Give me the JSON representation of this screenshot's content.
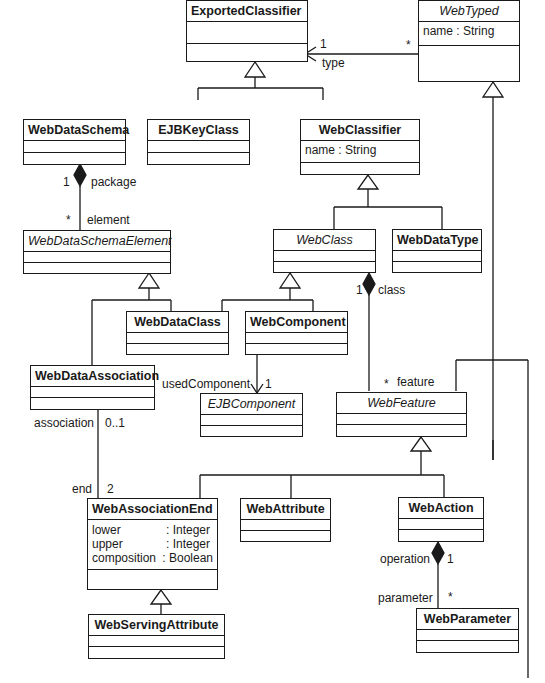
{
  "diagram": {
    "type": "UML class diagram",
    "classes": {
      "exported_classifier": {
        "name": "ExportedClassifier"
      },
      "web_typed": {
        "name": "WebTyped",
        "attributes": [
          {
            "name": "name : String"
          }
        ]
      },
      "web_data_schema": {
        "name": "WebDataSchema"
      },
      "ejb_key_class": {
        "name": "EJBKeyClass"
      },
      "web_classifier": {
        "name": "WebClassifier",
        "attributes": [
          {
            "name": "name : String"
          }
        ]
      },
      "web_data_schema_element": {
        "name": "WebDataSchemaElement"
      },
      "web_class": {
        "name": "WebClass"
      },
      "web_data_type": {
        "name": "WebDataType"
      },
      "web_data_class": {
        "name": "WebDataClass"
      },
      "web_component": {
        "name": "WebComponent"
      },
      "web_data_association": {
        "name": "WebDataAssociation"
      },
      "ejb_component": {
        "name": "EJBComponent"
      },
      "web_feature": {
        "name": "WebFeature"
      },
      "web_association_end": {
        "name": "WebAssociationEnd",
        "attributes": [
          {
            "name": "lower",
            "type": ": Integer"
          },
          {
            "name": "upper",
            "type": ": Integer"
          },
          {
            "name": "composition",
            "type": ": Boolean"
          }
        ]
      },
      "web_attribute": {
        "name": "WebAttribute"
      },
      "web_action": {
        "name": "WebAction"
      },
      "web_serving_attribute": {
        "name": "WebServingAttribute"
      },
      "web_parameter": {
        "name": "WebParameter"
      }
    },
    "labels": {
      "type_mult": "1",
      "type_role": "type",
      "webtyped_mult": "*",
      "package_mult": "1",
      "package_role": "package",
      "element_mult": "*",
      "element_role": "element",
      "class_mult": "1",
      "class_role": "class",
      "feature_mult": "*",
      "feature_role": "feature",
      "used_component_role": "usedComponent",
      "used_component_mult": "1",
      "association_role": "association",
      "association_mult": "0..1",
      "end_role": "end",
      "end_mult": "2",
      "operation_role": "operation",
      "operation_mult": "1",
      "parameter_role": "parameter",
      "parameter_mult": "*"
    },
    "colors": {
      "line": "#1a1a1a",
      "background": "#ffffff"
    }
  }
}
